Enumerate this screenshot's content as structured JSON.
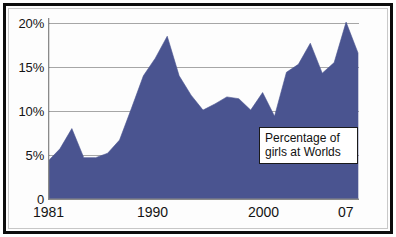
{
  "chart_data": {
    "type": "area",
    "title": "",
    "annotation": {
      "line1": "Percentage of",
      "line2": "girls at Worlds"
    },
    "xlabel": "",
    "ylabel": "",
    "xlim": [
      1981,
      2007
    ],
    "ylim": [
      0,
      21.5
    ],
    "grid": true,
    "gridlines_y": [
      5,
      10,
      15,
      20
    ],
    "legend": "none",
    "series_color": "#4a5490",
    "x_tick_labels": [
      "1981",
      "1990",
      "2000",
      "07"
    ],
    "x_tick_values": [
      1981,
      1990,
      2000,
      2007
    ],
    "y_tick_labels": [
      "0",
      "5%",
      "10%",
      "15%",
      "20%"
    ],
    "y_tick_values": [
      0,
      5,
      10,
      15,
      20
    ],
    "x": [
      1981,
      1982,
      1983,
      1984,
      1985,
      1986,
      1987,
      1988,
      1989,
      1990,
      1991,
      1992,
      1993,
      1994,
      1995,
      1996,
      1997,
      1998,
      1999,
      2000,
      2001,
      2002,
      2003,
      2004,
      2005,
      2006,
      2007
    ],
    "values": [
      4.3,
      5.7,
      8.0,
      4.7,
      4.7,
      5.2,
      6.7,
      10.3,
      14.0,
      16.0,
      18.5,
      14.0,
      11.8,
      10.1,
      10.8,
      11.6,
      11.4,
      10.1,
      12.1,
      9.4,
      14.4,
      15.3,
      17.7,
      14.3,
      15.5,
      20.1,
      16.6
    ],
    "series": [
      {
        "name": "Percentage of girls at Worlds",
        "values": [
          4.3,
          5.7,
          8.0,
          4.7,
          4.7,
          5.2,
          6.7,
          10.3,
          14.0,
          16.0,
          18.5,
          14.0,
          11.8,
          10.1,
          10.8,
          11.6,
          11.4,
          10.1,
          12.1,
          9.4,
          14.4,
          15.3,
          17.7,
          14.3,
          15.5,
          20.1,
          16.6
        ]
      }
    ]
  },
  "axes": {
    "y_ticks": [
      {
        "label": "20%",
        "value": 20
      },
      {
        "label": "15%",
        "value": 15
      },
      {
        "label": "10%",
        "value": 10
      },
      {
        "label": "5%",
        "value": 5
      },
      {
        "label": "0",
        "value": 0
      }
    ],
    "x_ticks": [
      {
        "label": "1981",
        "value": 1981
      },
      {
        "label": "1990",
        "value": 1990
      },
      {
        "label": "2000",
        "value": 2000
      },
      {
        "label": "07",
        "value": 2007
      }
    ]
  },
  "colors": {
    "area_fill": "#4a5490",
    "frame": "#0d0d0d",
    "gridline": "#a6a6a6",
    "axis": "#8a8a8a",
    "text": "#141414",
    "background": "#fdfdfd"
  }
}
